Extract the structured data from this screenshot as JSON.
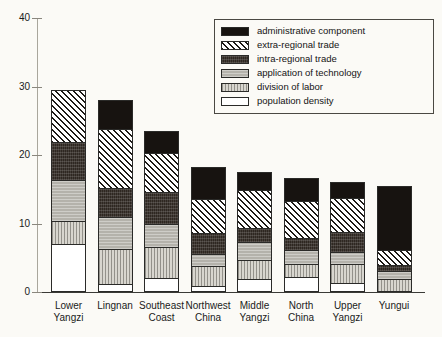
{
  "chart_data": {
    "type": "bar",
    "subtype": "stacked-bar",
    "title": "",
    "xlabel": "",
    "ylabel": "",
    "ylim": [
      0,
      40
    ],
    "yticks": [
      0,
      10,
      20,
      30,
      40
    ],
    "ytick_labels": [
      "0",
      "10",
      "20",
      "30",
      "40"
    ],
    "grid": false,
    "legend_position": "top-right",
    "categories": [
      "Lower Yangzi",
      "Lingnan",
      "Southeast Coast",
      "Northwest China",
      "Middle Yangzi",
      "North China",
      "Upper Yangzi",
      "Yungui"
    ],
    "category_lines": [
      [
        "Lower",
        "Yangzi"
      ],
      [
        "Lingnan",
        ""
      ],
      [
        "Southeast",
        "Coast"
      ],
      [
        "Northwest",
        "China"
      ],
      [
        "Middle",
        "Yangzi"
      ],
      [
        "North",
        "China"
      ],
      [
        "Upper",
        "Yangzi"
      ],
      [
        "Yungui",
        ""
      ]
    ],
    "series": [
      {
        "name": "administrative component",
        "key": "admin",
        "fill": "solid-black",
        "values": [
          0.0,
          4.2,
          3.3,
          4.8,
          2.7,
          3.4,
          2.3,
          9.5
        ]
      },
      {
        "name": "extra-regional trade",
        "key": "extra",
        "fill": "diagonal-hatch",
        "values": [
          7.7,
          8.7,
          5.7,
          5.1,
          5.6,
          5.4,
          5.1,
          2.3
        ]
      },
      {
        "name": "intra-regional trade",
        "key": "intra",
        "fill": "dark-speckle",
        "values": [
          5.6,
          4.4,
          4.8,
          3.0,
          2.1,
          1.8,
          2.9,
          0.9
        ]
      },
      {
        "name": "application of technology",
        "key": "technology",
        "fill": "mid-grey",
        "values": [
          6.0,
          4.7,
          3.4,
          1.8,
          2.7,
          2.2,
          1.9,
          1.1
        ]
      },
      {
        "name": "division of labor",
        "key": "labor",
        "fill": "light-grey-lines",
        "values": [
          3.4,
          5.1,
          4.5,
          3.0,
          2.7,
          1.8,
          2.7,
          1.7
        ]
      },
      {
        "name": "population density",
        "key": "population",
        "fill": "white",
        "values": [
          6.8,
          0.9,
          1.8,
          0.6,
          1.7,
          2.0,
          1.1,
          0.0
        ]
      }
    ],
    "totals": [
      29.5,
      28.0,
      23.5,
      18.3,
      17.5,
      16.6,
      16.0,
      15.5
    ],
    "stack_order_bottom_to_top": [
      "population density",
      "division of labor",
      "application of technology",
      "intra-regional trade",
      "extra-regional trade",
      "administrative component"
    ]
  },
  "legend": {
    "items": [
      {
        "label": "administrative component",
        "swatch": "solid-black"
      },
      {
        "label": "extra-regional trade",
        "swatch": "diagonal-hatch"
      },
      {
        "label": "intra-regional trade",
        "swatch": "dark-speckle"
      },
      {
        "label": "application of technology",
        "swatch": "mid-grey"
      },
      {
        "label": "division of labor",
        "swatch": "light-grey-lines"
      },
      {
        "label": "population density",
        "swatch": "white"
      }
    ]
  },
  "colors": {
    "background": "#fbfaf6",
    "axis": "#3a3a36",
    "outline": "#2a2a28",
    "admin": "#171310",
    "intra": "#2e2721",
    "technology": "#b4b2ab",
    "labor": "#d8d6cf",
    "population": "#ffffff"
  }
}
